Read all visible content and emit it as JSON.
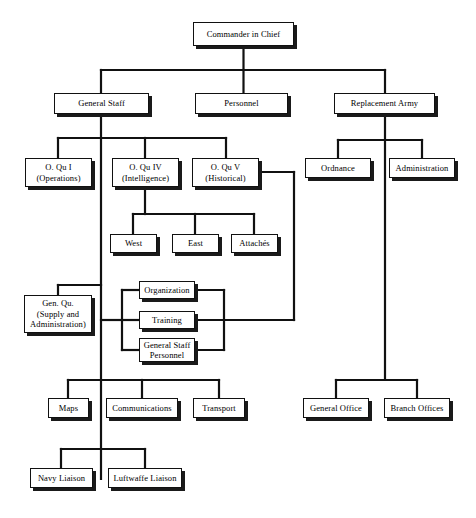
{
  "chart_data": {
    "type": "diagram",
    "diagram_type": "organizational-chart",
    "title": "",
    "root": "Commander in Chief",
    "nodes": [
      {
        "id": "cinc",
        "label": "Commander in Chief",
        "x": 193,
        "y": 22,
        "w": 101,
        "h": 24
      },
      {
        "id": "genstaff",
        "label": "General Staff",
        "x": 54,
        "y": 93,
        "w": 95,
        "h": 21
      },
      {
        "id": "personnel",
        "label": "Personnel",
        "x": 195,
        "y": 93,
        "w": 93,
        "h": 21
      },
      {
        "id": "replarmy",
        "label": "Replacement Army",
        "x": 334,
        "y": 93,
        "w": 101,
        "h": 21
      },
      {
        "id": "oqu1",
        "label": "O. Qu I\n(Operations)",
        "x": 25,
        "y": 158,
        "w": 67,
        "h": 29
      },
      {
        "id": "oqu4",
        "label": "O. Qu IV\n(Intelligence)",
        "x": 112,
        "y": 158,
        "w": 67,
        "h": 29
      },
      {
        "id": "oqu5",
        "label": "O. Qu V\n(Historical)",
        "x": 192,
        "y": 158,
        "w": 67,
        "h": 29
      },
      {
        "id": "ordnance",
        "label": "Ordnance",
        "x": 305,
        "y": 158,
        "w": 66,
        "h": 20
      },
      {
        "id": "admin",
        "label": "Administration",
        "x": 389,
        "y": 158,
        "w": 66,
        "h": 20
      },
      {
        "id": "west",
        "label": "West",
        "x": 110,
        "y": 234,
        "w": 47,
        "h": 19
      },
      {
        "id": "east",
        "label": "East",
        "x": 172,
        "y": 234,
        "w": 47,
        "h": 19
      },
      {
        "id": "attaches",
        "label": "Attachés",
        "x": 231,
        "y": 234,
        "w": 47,
        "h": 19
      },
      {
        "id": "genqu",
        "label": "Gen. Qu.\n(Supply and\nAdministration)",
        "x": 24,
        "y": 295,
        "w": 68,
        "h": 38
      },
      {
        "id": "organization",
        "label": "Organization",
        "x": 139,
        "y": 281,
        "w": 56,
        "h": 18
      },
      {
        "id": "training",
        "label": "Training",
        "x": 139,
        "y": 311,
        "w": 56,
        "h": 18
      },
      {
        "id": "gsp",
        "label": "General Staff\nPersonnel",
        "x": 139,
        "y": 338,
        "w": 56,
        "h": 24
      },
      {
        "id": "maps",
        "label": "Maps",
        "x": 48,
        "y": 398,
        "w": 41,
        "h": 20
      },
      {
        "id": "comms",
        "label": "Communications",
        "x": 106,
        "y": 398,
        "w": 72,
        "h": 20
      },
      {
        "id": "transport",
        "label": "Transport",
        "x": 193,
        "y": 398,
        "w": 52,
        "h": 20
      },
      {
        "id": "genoffice",
        "label": "General Office",
        "x": 303,
        "y": 398,
        "w": 66,
        "h": 20
      },
      {
        "id": "branchoffice",
        "label": "Branch Offices",
        "x": 384,
        "y": 398,
        "w": 66,
        "h": 20
      },
      {
        "id": "navy",
        "label": "Navy Liaison",
        "x": 30,
        "y": 468,
        "w": 63,
        "h": 20
      },
      {
        "id": "luftwaffe",
        "label": "Luftwaffe Liaison",
        "x": 108,
        "y": 468,
        "w": 74,
        "h": 20
      }
    ],
    "edges": [
      {
        "from": "cinc",
        "to": "genstaff"
      },
      {
        "from": "cinc",
        "to": "personnel"
      },
      {
        "from": "cinc",
        "to": "replarmy"
      },
      {
        "from": "genstaff",
        "to": "oqu1"
      },
      {
        "from": "genstaff",
        "to": "oqu4"
      },
      {
        "from": "genstaff",
        "to": "oqu5"
      },
      {
        "from": "genstaff",
        "to": "genqu"
      },
      {
        "from": "genstaff",
        "to": "organization"
      },
      {
        "from": "genstaff",
        "to": "training"
      },
      {
        "from": "genstaff",
        "to": "gsp"
      },
      {
        "from": "genstaff",
        "to": "maps"
      },
      {
        "from": "genstaff",
        "to": "comms"
      },
      {
        "from": "genstaff",
        "to": "transport"
      },
      {
        "from": "genstaff",
        "to": "navy"
      },
      {
        "from": "genstaff",
        "to": "luftwaffe"
      },
      {
        "from": "oqu4",
        "to": "west"
      },
      {
        "from": "oqu4",
        "to": "east"
      },
      {
        "from": "oqu4",
        "to": "attaches"
      },
      {
        "from": "oqu5",
        "to": "organization"
      },
      {
        "from": "oqu5",
        "to": "training"
      },
      {
        "from": "oqu5",
        "to": "gsp"
      },
      {
        "from": "replarmy",
        "to": "ordnance"
      },
      {
        "from": "replarmy",
        "to": "admin"
      },
      {
        "from": "replarmy",
        "to": "genoffice"
      },
      {
        "from": "replarmy",
        "to": "branchoffice"
      }
    ],
    "style": {
      "line_color": "#111111",
      "box_fill": "#ffffff",
      "box_border": "#111111",
      "shadow_color": "#1a1a1a",
      "background": "#ffffff"
    }
  }
}
